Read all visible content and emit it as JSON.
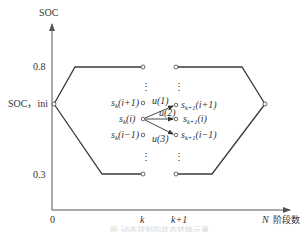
{
  "diagram": {
    "y_axis_label": "SOC",
    "x_axis_label": "阶段数",
    "y_ticks": {
      "upper": "0.8",
      "initial": "SOC，ini",
      "lower": "0.3"
    },
    "x_ticks": {
      "origin": "0",
      "k": "k",
      "k_plus_1": "k+1",
      "N": "N"
    },
    "states_k": {
      "upper": "s",
      "upper_sub": "k",
      "upper_arg": "(i+1)",
      "middle": "s",
      "middle_sub": "k",
      "middle_arg": "(i)",
      "lower": "s",
      "lower_sub": "k",
      "lower_arg": "(i−1)"
    },
    "states_k1": {
      "upper": "s",
      "upper_sub": "k+1",
      "upper_arg": "(i+1)",
      "middle": "s",
      "middle_sub": "k+1",
      "middle_arg": "(i)",
      "lower": "s",
      "lower_sub": "k+1",
      "lower_arg": "(i−1)"
    },
    "controls": {
      "u1": "u(1)",
      "u2": "u(2)",
      "u3": "u(3)"
    },
    "ellipsis": "⋮",
    "caption": "图 动态规划的状态转移示意"
  },
  "colors": {
    "line": "#3a3a3a",
    "axis": "#555555",
    "text": "#333333",
    "background": "#ffffff"
  }
}
